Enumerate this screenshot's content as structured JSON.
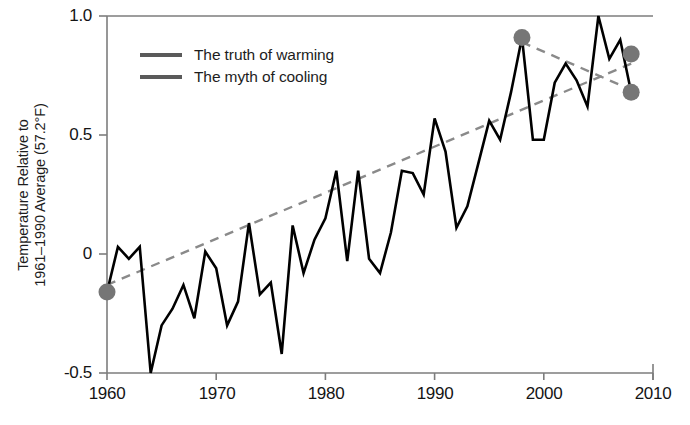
{
  "chart_data": {
    "type": "line",
    "title": "",
    "xlabel": "",
    "ylabel": "Temperature Relative to\n1961–1990 Average (57.2°F)",
    "xlim": [
      1960,
      2010
    ],
    "ylim": [
      -0.5,
      1.0
    ],
    "xticks": [
      1960,
      1970,
      1980,
      1990,
      2000,
      2010
    ],
    "xtick_labels": [
      "1960",
      "1970",
      "1980",
      "1990",
      "2000",
      "2010"
    ],
    "yticks": [
      -0.5,
      0,
      0.5,
      1.0
    ],
    "ytick_labels": [
      "-0.5",
      "0",
      "0.5",
      "1.0"
    ],
    "grid": false,
    "legend_position": "upper-left-inside",
    "legend": [
      {
        "label": "The truth of warming",
        "color": "#5a5a5a",
        "style": "solid"
      },
      {
        "label": "The myth of cooling",
        "color": "#5a5a5a",
        "style": "solid"
      }
    ],
    "series": [
      {
        "name": "Annual temperature anomaly",
        "type": "line",
        "color": "#000000",
        "x": [
          1960,
          1961,
          1962,
          1963,
          1964,
          1965,
          1966,
          1967,
          1968,
          1969,
          1970,
          1971,
          1972,
          1973,
          1974,
          1975,
          1976,
          1977,
          1978,
          1979,
          1980,
          1981,
          1982,
          1983,
          1984,
          1985,
          1986,
          1987,
          1988,
          1989,
          1990,
          1991,
          1992,
          1993,
          1994,
          1995,
          1996,
          1997,
          1998,
          1999,
          2000,
          2001,
          2002,
          2003,
          2004,
          2005,
          2006,
          2007,
          2008
        ],
        "y": [
          -0.16,
          0.03,
          -0.02,
          0.03,
          -0.5,
          -0.3,
          -0.23,
          -0.13,
          -0.27,
          0.01,
          -0.06,
          -0.3,
          -0.2,
          0.13,
          -0.17,
          -0.12,
          -0.42,
          0.12,
          -0.08,
          0.06,
          0.15,
          0.35,
          -0.03,
          0.35,
          -0.02,
          -0.08,
          0.09,
          0.35,
          0.34,
          0.25,
          0.57,
          0.43,
          0.11,
          0.2,
          0.38,
          0.56,
          0.48,
          0.68,
          0.91,
          0.48,
          0.48,
          0.72,
          0.8,
          0.73,
          0.62,
          1.0,
          0.82,
          0.9,
          0.68
        ]
      },
      {
        "name": "Long-term warming trend",
        "type": "trendline",
        "color": "#8a8a8a",
        "style": "dashed",
        "x": [
          1960,
          2008
        ],
        "y": [
          -0.13,
          0.8
        ]
      },
      {
        "name": "Short-term cooling trend",
        "type": "trendline",
        "color": "#8a8a8a",
        "style": "dashed",
        "x": [
          1998,
          2008
        ],
        "y": [
          0.89,
          0.69
        ]
      }
    ],
    "markers": [
      {
        "name": "start-point",
        "x": 1960,
        "y": -0.16,
        "color": "#767676"
      },
      {
        "name": "1998-peak-point",
        "x": 1998,
        "y": 0.91,
        "color": "#767676"
      },
      {
        "name": "2008-warming-endpoint",
        "x": 2008,
        "y": 0.84,
        "color": "#767676"
      },
      {
        "name": "2008-cooling-endpoint",
        "x": 2008,
        "y": 0.68,
        "color": "#767676"
      }
    ],
    "colors": {
      "data_line": "#000000",
      "trend_line": "#8a8a8a",
      "marker": "#767676",
      "axis": "#7d7d7d",
      "text": "#1a1a1a",
      "background": "#ffffff"
    }
  }
}
